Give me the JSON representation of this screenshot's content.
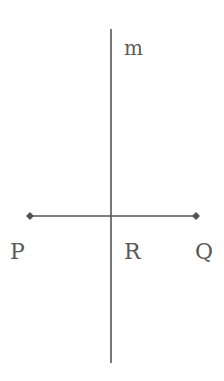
{
  "diagram": {
    "line_color": "#555555",
    "text_color": "#5a5a5a",
    "line_m": {
      "label": "m",
      "x": 111,
      "y1": 29,
      "y2": 363
    },
    "segment_PQ": {
      "y": 216,
      "x1": 30,
      "x2": 196
    },
    "points": [
      {
        "name": "P",
        "label": "P",
        "x": 30,
        "y": 216
      },
      {
        "name": "R",
        "label": "R",
        "x": 111,
        "y": 216
      },
      {
        "name": "Q",
        "label": "Q",
        "x": 196,
        "y": 216
      }
    ],
    "labels": {
      "m": "m",
      "P": "P",
      "R": "R",
      "Q": "Q"
    }
  }
}
